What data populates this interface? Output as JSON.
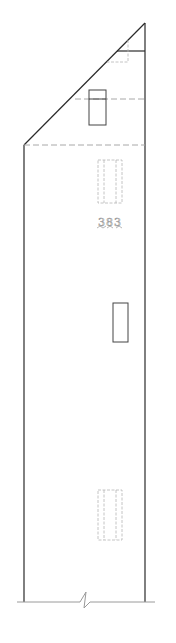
{
  "drawing": {
    "type": "architectural-elevation",
    "unit_label": "383",
    "colors": {
      "outline": "#2a2a2a",
      "hidden_line": "#a8a8a8",
      "ground_line": "#9a9a9a",
      "background": "#ffffff"
    },
    "elements": {
      "roof_apex": {
        "x": 145,
        "y": 23
      },
      "eave_left": {
        "x": 24,
        "y": 145
      },
      "walls": {
        "left_x": 24,
        "right_x": 145,
        "bottom_y": 602
      },
      "windows": [
        {
          "name": "attic-window",
          "x": 89,
          "y": 90,
          "w": 17,
          "h": 35,
          "transom_y": 99
        },
        {
          "name": "side-window",
          "x": 113,
          "y": 303,
          "w": 15,
          "h": 39
        }
      ],
      "hidden_doors": [
        {
          "name": "upper-door",
          "x": 98,
          "y": 160,
          "w": 24,
          "h": 43
        },
        {
          "name": "lower-door",
          "x": 98,
          "y": 490,
          "w": 24,
          "h": 50
        }
      ],
      "break_symbol": {
        "x": 85,
        "y": 602
      }
    }
  }
}
